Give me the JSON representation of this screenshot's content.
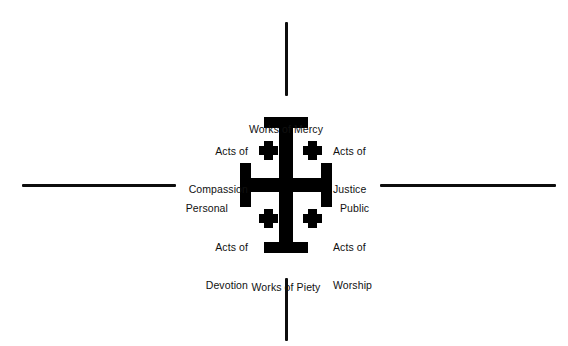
{
  "diagram": {
    "type": "jerusalem-cross-quadrant-diagram",
    "background_color": "#ffffff",
    "ink_color": "#000000"
  },
  "axes": {
    "horizontal": {
      "left_label": "Personal",
      "right_label": "Public",
      "line_color": "#0d0d0d",
      "thickness_px": 3
    },
    "vertical": {
      "top_label": "Works of Mercy",
      "bottom_label": "Works of Piety",
      "line_color": "#0d0d0d",
      "thickness_px": 3
    }
  },
  "labels": {
    "top": "Works of Mercy",
    "bottom": "Works of Piety",
    "left": "Personal",
    "right": "Public"
  },
  "quadrants": [
    {
      "position": "top-left",
      "line1": "Acts of",
      "line2": "Compassion",
      "full": "Acts of Compassion",
      "align": "right"
    },
    {
      "position": "top-right",
      "line1": "Acts of",
      "line2": "Justice",
      "full": "Acts of Justice",
      "align": "left"
    },
    {
      "position": "bottom-left",
      "line1": "Acts of",
      "line2": "Devotion",
      "full": "Acts of Devotion",
      "align": "right"
    },
    {
      "position": "bottom-right",
      "line1": "Acts of",
      "line2": "Worship",
      "full": "Acts of Worship",
      "align": "left"
    }
  ],
  "emblem": {
    "name": "jerusalem-cross",
    "description": "Jerusalem Cross: a large potent cross with four small Greek crosslets in the quadrants",
    "color": "#000000",
    "crosslet_count": 4
  }
}
